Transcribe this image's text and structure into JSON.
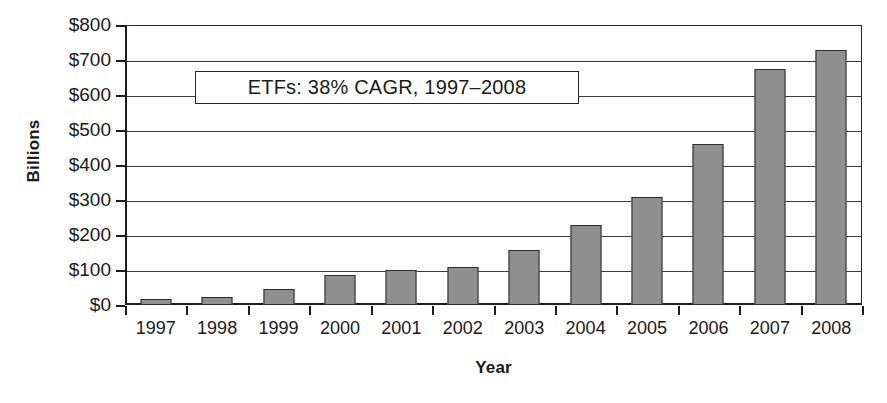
{
  "chart_data": {
    "type": "bar",
    "title": "",
    "subtitle": "",
    "xlabel": "Year",
    "ylabel": "Billions",
    "categories": [
      "1997",
      "1998",
      "1999",
      "2000",
      "2001",
      "2002",
      "2003",
      "2004",
      "2005",
      "2006",
      "2007",
      "2008"
    ],
    "values": [
      16,
      22,
      46,
      85,
      101,
      110,
      157,
      228,
      310,
      460,
      675,
      730
    ],
    "series": [
      {
        "name": "ETF assets",
        "values": [
          16,
          22,
          46,
          85,
          101,
          110,
          157,
          228,
          310,
          460,
          675,
          730
        ]
      }
    ],
    "ylim": [
      0,
      800
    ],
    "y_ticks": [
      0,
      100,
      200,
      300,
      400,
      500,
      600,
      700,
      800
    ],
    "y_tick_labels": [
      "$0",
      "$100",
      "$200",
      "$300",
      "$400",
      "$500",
      "$600",
      "$700",
      "$800"
    ],
    "grid": true,
    "legend": "none",
    "annotations": [
      {
        "text": "ETFs: 38% CAGR, 1997–2008",
        "x_position": "plot-upper-left",
        "y_value": 620
      }
    ],
    "colors": {
      "bar_fill": "#8f8f8f",
      "bar_border": "#2b2b2b",
      "gridline": "#3a3a3a",
      "axis": "#1c1c1c",
      "background": "#ffffff",
      "text": "#1a1a1a"
    }
  }
}
